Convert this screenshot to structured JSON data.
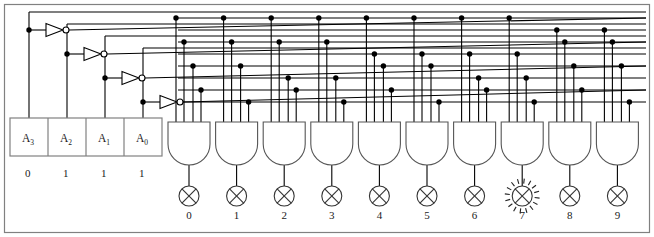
{
  "diagram": {
    "colors": {
      "wire": "#000000",
      "frame": "#808080",
      "gate_stroke": "#555555",
      "lamp_stroke": "#333333",
      "background": "#ffffff"
    }
  },
  "inputs": {
    "labels": [
      "A",
      "A",
      "A",
      "A"
    ],
    "subscripts": [
      "3",
      "2",
      "1",
      "0"
    ],
    "values": [
      "0",
      "1",
      "1",
      "1"
    ]
  },
  "inverters": [
    {
      "name": "inverter-a3"
    },
    {
      "name": "inverter-a2"
    },
    {
      "name": "inverter-a1"
    },
    {
      "name": "inverter-a0"
    }
  ],
  "gates": [
    {
      "label": "0"
    },
    {
      "label": "1"
    },
    {
      "label": "2"
    },
    {
      "label": "3"
    },
    {
      "label": "4"
    },
    {
      "label": "5"
    },
    {
      "label": "6"
    },
    {
      "label": "7"
    },
    {
      "label": "8"
    },
    {
      "label": "9"
    }
  ],
  "outputs": {
    "labels": [
      "0",
      "1",
      "2",
      "3",
      "4",
      "5",
      "6",
      "7",
      "8",
      "9"
    ],
    "lit_index": 7,
    "lit_label": "7"
  },
  "buses": {
    "count": 8,
    "order": [
      "A3bar",
      "A3",
      "A2bar",
      "A2",
      "A1bar",
      "A1",
      "A0bar",
      "A0"
    ]
  }
}
